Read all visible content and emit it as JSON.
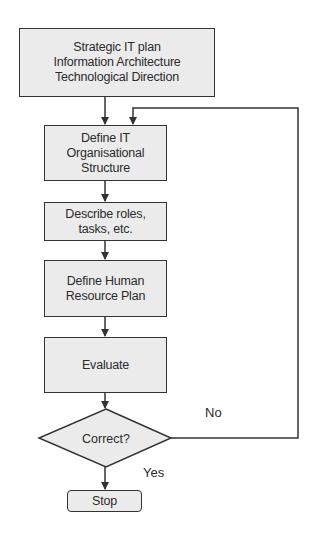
{
  "diagram": {
    "type": "flowchart",
    "colors": {
      "box_fill": "#ebebeb",
      "stroke": "#333333",
      "text": "#2b2b2b",
      "background": "#ffffff"
    },
    "nodes": {
      "strategic": {
        "shape": "rectangle",
        "lines": [
          "Strategic IT plan",
          "Information Architecture",
          "Technological Direction"
        ]
      },
      "define_structure": {
        "shape": "rectangle",
        "lines": [
          "Define IT",
          "Organisational",
          "Structure"
        ]
      },
      "describe_roles": {
        "shape": "rectangle",
        "lines": [
          "Describe roles,",
          "tasks, etc."
        ]
      },
      "hr_plan": {
        "shape": "rectangle",
        "lines": [
          "Define Human",
          "Resource Plan"
        ]
      },
      "evaluate": {
        "shape": "rectangle",
        "lines": [
          "Evaluate"
        ]
      },
      "correct": {
        "shape": "diamond",
        "label": "Correct?"
      },
      "stop": {
        "shape": "rounded-rectangle",
        "label": "Stop"
      }
    },
    "edges": [
      {
        "from": "strategic",
        "to": "define_structure",
        "label": ""
      },
      {
        "from": "define_structure",
        "to": "describe_roles",
        "label": ""
      },
      {
        "from": "describe_roles",
        "to": "hr_plan",
        "label": ""
      },
      {
        "from": "hr_plan",
        "to": "evaluate",
        "label": ""
      },
      {
        "from": "evaluate",
        "to": "correct",
        "label": ""
      },
      {
        "from": "correct",
        "to": "stop",
        "label": "Yes"
      },
      {
        "from": "correct",
        "to": "define_structure",
        "label": "No"
      }
    ],
    "edge_labels": {
      "yes": "Yes",
      "no": "No"
    }
  }
}
